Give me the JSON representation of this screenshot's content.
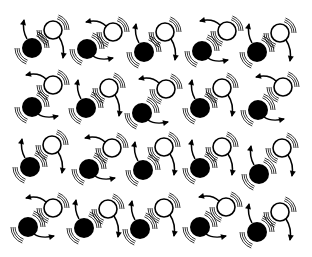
{
  "diagram": {
    "width": 312,
    "height": 257,
    "colors": {
      "background": "#ffffff",
      "ink": "#000000"
    },
    "black_radius": 10,
    "white_radius": 9,
    "pair_types": {
      "A": "black disc lower-left with up-curving arrow from its top; white disc upper-right with down-curving arrow from its bottom",
      "B": "white disc upper-right with left-curving arrow from its top; black disc lower-left with right-curving arrow from its bottom"
    },
    "pairs": [
      {
        "row": 1,
        "col": 1,
        "type": "A",
        "black": [
          32,
          48
        ],
        "white": [
          53,
          30
        ]
      },
      {
        "row": 1,
        "col": 2,
        "type": "B",
        "black": [
          87,
          49
        ],
        "white": [
          113,
          32
        ]
      },
      {
        "row": 1,
        "col": 3,
        "type": "A",
        "black": [
          144,
          52
        ],
        "white": [
          165,
          32
        ]
      },
      {
        "row": 1,
        "col": 4,
        "type": "B",
        "black": [
          202,
          51
        ],
        "white": [
          227,
          31
        ]
      },
      {
        "row": 1,
        "col": 5,
        "type": "A",
        "black": [
          257,
          52
        ],
        "white": [
          280,
          33
        ]
      },
      {
        "row": 2,
        "col": 1,
        "type": "B",
        "black": [
          32,
          107
        ],
        "white": [
          53,
          85
        ]
      },
      {
        "row": 2,
        "col": 2,
        "type": "A",
        "black": [
          86,
          108
        ],
        "white": [
          109,
          88
        ]
      },
      {
        "row": 2,
        "col": 3,
        "type": "B",
        "black": [
          142,
          113
        ],
        "white": [
          166,
          89
        ]
      },
      {
        "row": 2,
        "col": 4,
        "type": "A",
        "black": [
          200,
          108
        ],
        "white": [
          222,
          88
        ]
      },
      {
        "row": 2,
        "col": 5,
        "type": "B",
        "black": [
          258,
          110
        ],
        "white": [
          283,
          87
        ]
      },
      {
        "row": 3,
        "col": 1,
        "type": "A",
        "black": [
          30,
          167
        ],
        "white": [
          52,
          145
        ]
      },
      {
        "row": 3,
        "col": 2,
        "type": "B",
        "black": [
          89,
          169
        ],
        "white": [
          112,
          148
        ]
      },
      {
        "row": 3,
        "col": 3,
        "type": "A",
        "black": [
          143,
          170
        ],
        "white": [
          164,
          147
        ]
      },
      {
        "row": 3,
        "col": 4,
        "type": "A",
        "black": [
          200,
          168
        ],
        "white": [
          222,
          147
        ]
      },
      {
        "row": 3,
        "col": 5,
        "type": "A",
        "black": [
          259,
          174
        ],
        "white": [
          282,
          148
        ]
      },
      {
        "row": 4,
        "col": 1,
        "type": "B",
        "black": [
          28,
          227
        ],
        "white": [
          53,
          208
        ]
      },
      {
        "row": 4,
        "col": 2,
        "type": "A",
        "black": [
          84,
          228
        ],
        "white": [
          108,
          209
        ]
      },
      {
        "row": 4,
        "col": 3,
        "type": "A",
        "black": [
          140,
          229
        ],
        "white": [
          164,
          208
        ]
      },
      {
        "row": 4,
        "col": 4,
        "type": "B",
        "black": [
          200,
          227
        ],
        "white": [
          226,
          207
        ]
      },
      {
        "row": 4,
        "col": 5,
        "type": "A",
        "black": [
          257,
          232
        ],
        "white": [
          280,
          212
        ]
      }
    ]
  }
}
